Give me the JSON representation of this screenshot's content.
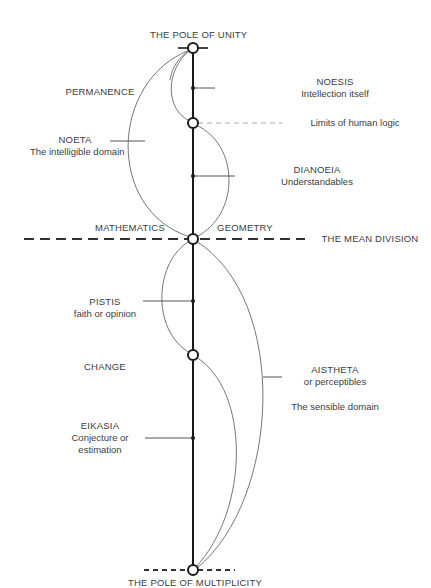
{
  "poles": {
    "top": "THE POLE OF UNITY",
    "bottom": "THE POLE OF MULTIPLICITY"
  },
  "mean_division": "THE MEAN DIVISION",
  "limits": "Limits of human logic",
  "side_labels": {
    "permanence": "PERMANENCE",
    "change": "CHANGE",
    "mathematics": "MATHEMATICS",
    "geometry": "GEOMETRY"
  },
  "sections": {
    "noesis": {
      "title": "NOESIS",
      "subtitle": "Intellection itself"
    },
    "noeta": {
      "title": "NOETA",
      "subtitle": "The intelligible domain"
    },
    "dianoeia": {
      "title": "DIANOEIA",
      "subtitle": "Understandables"
    },
    "pistis": {
      "title": "PISTIS",
      "subtitle": "faith or opinion"
    },
    "aistheta": {
      "title": "AISTHETA",
      "subtitle": "or perceptibles",
      "note": "The sensible domain"
    },
    "eikasia": {
      "title": "EIKASIA",
      "subtitle_1": "Conjecture or",
      "subtitle_2": "estimation"
    }
  },
  "colors": {
    "axis": "#1a1a1a",
    "arc": "#777777",
    "text": "#3d3d3d",
    "dashed": "#333333",
    "limits_dash": "#aaaaaa"
  }
}
